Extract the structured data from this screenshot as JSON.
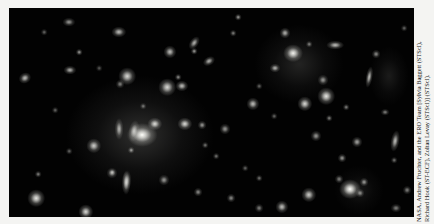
{
  "image": {
    "subject": "Hubble Space Telescope deep-field view of a massive galaxy cluster with many elliptical and spiral galaxies and faint gravitational arcs against a black sky",
    "background_color": "#020202",
    "glows": [
      {
        "x": 131,
        "y": 127,
        "w": 150,
        "h": 120,
        "a": 0.22
      },
      {
        "x": 290,
        "y": 56,
        "w": 90,
        "h": 80,
        "a": 0.16
      },
      {
        "x": 380,
        "y": 68,
        "w": 40,
        "h": 60,
        "a": 0.12
      },
      {
        "x": 350,
        "y": 182,
        "w": 50,
        "h": 50,
        "a": 0.1
      }
    ],
    "galaxies": [
      {
        "x": 133,
        "y": 127,
        "w": 14,
        "h": 11,
        "b": 1.0,
        "r": 0
      },
      {
        "x": 146,
        "y": 116,
        "w": 7,
        "h": 6,
        "b": 0.85,
        "r": 0
      },
      {
        "x": 125,
        "y": 123,
        "w": 5,
        "h": 10,
        "b": 0.7,
        "r": 10
      },
      {
        "x": 176,
        "y": 116,
        "w": 7,
        "h": 6,
        "b": 0.85,
        "r": 0
      },
      {
        "x": 193,
        "y": 117,
        "w": 4,
        "h": 4,
        "b": 0.6,
        "r": 0
      },
      {
        "x": 110,
        "y": 121,
        "w": 4,
        "h": 10,
        "b": 0.7,
        "r": 0
      },
      {
        "x": 85,
        "y": 138,
        "w": 7,
        "h": 7,
        "b": 0.8,
        "r": 0
      },
      {
        "x": 122,
        "y": 142,
        "w": 3,
        "h": 3,
        "b": 0.6,
        "r": 0
      },
      {
        "x": 103,
        "y": 165,
        "w": 5,
        "h": 5,
        "b": 0.6,
        "r": 0
      },
      {
        "x": 118,
        "y": 172,
        "w": 4,
        "h": 9,
        "b": 0.6,
        "r": 0
      },
      {
        "x": 155,
        "y": 172,
        "w": 5,
        "h": 5,
        "b": 0.6,
        "r": 0
      },
      {
        "x": 27,
        "y": 190,
        "w": 8,
        "h": 8,
        "b": 0.9,
        "r": 0
      },
      {
        "x": 77,
        "y": 204,
        "w": 7,
        "h": 7,
        "b": 0.85,
        "r": 0
      },
      {
        "x": 117,
        "y": 175,
        "w": 4,
        "h": 11,
        "b": 0.75,
        "r": 0
      },
      {
        "x": 103,
        "y": 164,
        "w": 3,
        "h": 3,
        "b": 0.5,
        "r": 0
      },
      {
        "x": 29,
        "y": 166,
        "w": 3,
        "h": 3,
        "b": 0.5,
        "r": 0
      },
      {
        "x": 16,
        "y": 70,
        "w": 6,
        "h": 5,
        "b": 0.75,
        "r": -30
      },
      {
        "x": 61,
        "y": 62,
        "w": 6,
        "h": 4,
        "b": 0.7,
        "r": 0
      },
      {
        "x": 70,
        "y": 44,
        "w": 3,
        "h": 3,
        "b": 0.6,
        "r": 0
      },
      {
        "x": 60,
        "y": 14,
        "w": 6,
        "h": 4,
        "b": 0.6,
        "r": 0
      },
      {
        "x": 110,
        "y": 24,
        "w": 7,
        "h": 5,
        "b": 0.75,
        "r": 0
      },
      {
        "x": 118,
        "y": 68,
        "w": 8,
        "h": 8,
        "b": 0.85,
        "r": 0
      },
      {
        "x": 111,
        "y": 76,
        "w": 4,
        "h": 4,
        "b": 0.5,
        "r": 0
      },
      {
        "x": 35,
        "y": 24,
        "w": 3,
        "h": 3,
        "b": 0.4,
        "r": 0
      },
      {
        "x": 161,
        "y": 44,
        "w": 6,
        "h": 6,
        "b": 0.75,
        "r": 0
      },
      {
        "x": 185,
        "y": 35,
        "w": 4,
        "h": 7,
        "b": 0.7,
        "r": 35
      },
      {
        "x": 185,
        "y": 43,
        "w": 3,
        "h": 3,
        "b": 0.6,
        "r": 0
      },
      {
        "x": 200,
        "y": 53,
        "w": 6,
        "h": 4,
        "b": 0.7,
        "r": -30
      },
      {
        "x": 229,
        "y": 9,
        "w": 3,
        "h": 3,
        "b": 0.6,
        "r": 0
      },
      {
        "x": 158,
        "y": 79,
        "w": 8,
        "h": 8,
        "b": 0.85,
        "r": 0
      },
      {
        "x": 173,
        "y": 78,
        "w": 6,
        "h": 5,
        "b": 0.75,
        "r": 0
      },
      {
        "x": 169,
        "y": 69,
        "w": 3,
        "h": 3,
        "b": 0.55,
        "r": 0
      },
      {
        "x": 276,
        "y": 25,
        "w": 5,
        "h": 5,
        "b": 0.7,
        "r": 0
      },
      {
        "x": 284,
        "y": 45,
        "w": 9,
        "h": 8,
        "b": 0.95,
        "r": 0
      },
      {
        "x": 300,
        "y": 36,
        "w": 3,
        "h": 3,
        "b": 0.5,
        "r": 0
      },
      {
        "x": 326,
        "y": 37,
        "w": 8,
        "h": 4,
        "b": 0.75,
        "r": 0
      },
      {
        "x": 266,
        "y": 60,
        "w": 5,
        "h": 4,
        "b": 0.7,
        "r": 0
      },
      {
        "x": 224,
        "y": 25,
        "w": 3,
        "h": 3,
        "b": 0.5,
        "r": 0
      },
      {
        "x": 314,
        "y": 72,
        "w": 5,
        "h": 5,
        "b": 0.6,
        "r": 0
      },
      {
        "x": 317,
        "y": 88,
        "w": 8,
        "h": 8,
        "b": 0.9,
        "r": 0
      },
      {
        "x": 296,
        "y": 96,
        "w": 7,
        "h": 7,
        "b": 0.85,
        "r": 0
      },
      {
        "x": 244,
        "y": 96,
        "w": 6,
        "h": 6,
        "b": 0.75,
        "r": 0
      },
      {
        "x": 216,
        "y": 121,
        "w": 5,
        "h": 5,
        "b": 0.6,
        "r": 0
      },
      {
        "x": 337,
        "y": 99,
        "w": 3,
        "h": 3,
        "b": 0.5,
        "r": 0
      },
      {
        "x": 360,
        "y": 69,
        "w": 3,
        "h": 10,
        "b": 0.75,
        "r": 10
      },
      {
        "x": 367,
        "y": 46,
        "w": 4,
        "h": 4,
        "b": 0.55,
        "r": 0
      },
      {
        "x": 307,
        "y": 128,
        "w": 5,
        "h": 5,
        "b": 0.6,
        "r": 0
      },
      {
        "x": 320,
        "y": 110,
        "w": 3,
        "h": 3,
        "b": 0.5,
        "r": 0
      },
      {
        "x": 330,
        "y": 171,
        "w": 4,
        "h": 4,
        "b": 0.5,
        "r": 0
      },
      {
        "x": 333,
        "y": 150,
        "w": 4,
        "h": 4,
        "b": 0.6,
        "r": 0
      },
      {
        "x": 341,
        "y": 181,
        "w": 10,
        "h": 9,
        "b": 1.0,
        "r": 0
      },
      {
        "x": 355,
        "y": 174,
        "w": 4,
        "h": 4,
        "b": 0.6,
        "r": 0
      },
      {
        "x": 351,
        "y": 185,
        "w": 4,
        "h": 4,
        "b": 0.55,
        "r": 0
      },
      {
        "x": 348,
        "y": 134,
        "w": 5,
        "h": 5,
        "b": 0.65,
        "r": 0
      },
      {
        "x": 386,
        "y": 133,
        "w": 4,
        "h": 10,
        "b": 0.75,
        "r": 10
      },
      {
        "x": 376,
        "y": 104,
        "w": 4,
        "h": 3,
        "b": 0.5,
        "r": 0
      },
      {
        "x": 385,
        "y": 152,
        "w": 3,
        "h": 3,
        "b": 0.45,
        "r": 0
      },
      {
        "x": 300,
        "y": 187,
        "w": 7,
        "h": 7,
        "b": 0.8,
        "r": 0
      },
      {
        "x": 273,
        "y": 199,
        "w": 6,
        "h": 6,
        "b": 0.75,
        "r": 0
      },
      {
        "x": 250,
        "y": 200,
        "w": 4,
        "h": 4,
        "b": 0.5,
        "r": 0
      },
      {
        "x": 222,
        "y": 190,
        "w": 4,
        "h": 4,
        "b": 0.55,
        "r": 0
      },
      {
        "x": 189,
        "y": 184,
        "w": 4,
        "h": 4,
        "b": 0.55,
        "r": 0
      },
      {
        "x": 207,
        "y": 148,
        "w": 3,
        "h": 3,
        "b": 0.45,
        "r": 0
      },
      {
        "x": 250,
        "y": 170,
        "w": 3,
        "h": 3,
        "b": 0.45,
        "r": 0
      },
      {
        "x": 387,
        "y": 200,
        "w": 5,
        "h": 4,
        "b": 0.5,
        "r": 0
      },
      {
        "x": 398,
        "y": 182,
        "w": 4,
        "h": 4,
        "b": 0.5,
        "r": 0
      },
      {
        "x": 196,
        "y": 137,
        "w": 3,
        "h": 3,
        "b": 0.45,
        "r": 0
      },
      {
        "x": 236,
        "y": 160,
        "w": 3,
        "h": 3,
        "b": 0.4,
        "r": 0
      },
      {
        "x": 265,
        "y": 108,
        "w": 3,
        "h": 3,
        "b": 0.4,
        "r": 0
      },
      {
        "x": 46,
        "y": 102,
        "w": 3,
        "h": 3,
        "b": 0.4,
        "r": 0
      },
      {
        "x": 60,
        "y": 143,
        "w": 3,
        "h": 3,
        "b": 0.4,
        "r": 0
      },
      {
        "x": 134,
        "y": 98,
        "w": 3,
        "h": 3,
        "b": 0.45,
        "r": 0
      },
      {
        "x": 90,
        "y": 60,
        "w": 3,
        "h": 3,
        "b": 0.35,
        "r": 0
      },
      {
        "x": 395,
        "y": 20,
        "w": 3,
        "h": 3,
        "b": 0.4,
        "r": 0
      },
      {
        "x": 250,
        "y": 78,
        "w": 3,
        "h": 3,
        "b": 0.4,
        "r": 0
      }
    ]
  },
  "credit": {
    "line1": "NASA, Andrew Fruchter, and the ERO Team [Sylvia Baggett (STScI),",
    "line2": "Richard Hook (ST-ECF), Zoltan Levay (STScI)] (STScI)."
  }
}
